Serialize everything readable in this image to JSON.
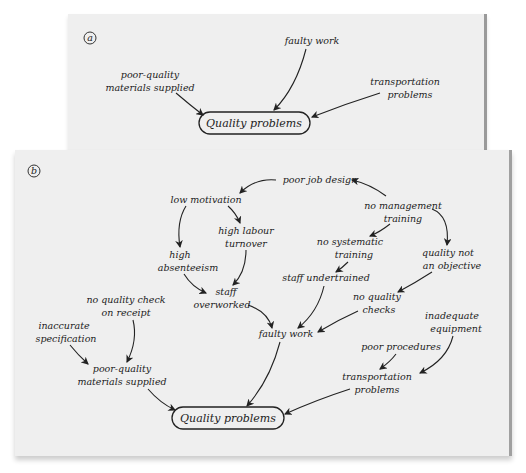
{
  "figure": {
    "panel_a": {
      "badge": "a",
      "center": "Quality problems",
      "causes": [
        {
          "id": "faulty_work",
          "lines": [
            "faulty work"
          ]
        },
        {
          "id": "poor_quality_materials",
          "lines": [
            "poor-quality",
            "materials supplied"
          ]
        },
        {
          "id": "transportation_problems",
          "lines": [
            "transportation",
            "problems"
          ]
        }
      ]
    },
    "panel_b": {
      "badge": "b",
      "center": "Quality problems",
      "nodes": {
        "poor_job_design": [
          "poor job design"
        ],
        "low_motivation": [
          "low motivation"
        ],
        "no_management_training": [
          "no management",
          "training"
        ],
        "high_labour_turnover": [
          "high labour",
          "turnover"
        ],
        "high_absenteeism": [
          "high",
          "absenteeism"
        ],
        "no_systematic_training": [
          "no systematic",
          "training"
        ],
        "quality_not_objective": [
          "quality not",
          "an objective"
        ],
        "staff_undertrained": [
          "staff undertrained"
        ],
        "staff_overworked": [
          "staff",
          "overworked"
        ],
        "no_quality_checks": [
          "no quality",
          "checks"
        ],
        "no_quality_check_receipt": [
          "no quality check",
          "on receipt"
        ],
        "inaccurate_specification": [
          "inaccurate",
          "specification"
        ],
        "inadequate_equipment": [
          "inadequate",
          "equipment"
        ],
        "faulty_work": [
          "faulty work"
        ],
        "poor_procedures": [
          "poor procedures"
        ],
        "poor_quality_materials": [
          "poor-quality",
          "materials supplied"
        ],
        "transportation_problems": [
          "transportation",
          "problems"
        ]
      },
      "edges": [
        [
          "poor_job_design",
          "low_motivation"
        ],
        [
          "no_management_training",
          "poor_job_design"
        ],
        [
          "low_motivation",
          "high_absenteeism"
        ],
        [
          "low_motivation",
          "high_labour_turnover"
        ],
        [
          "no_management_training",
          "no_systematic_training"
        ],
        [
          "no_management_training",
          "quality_not_objective"
        ],
        [
          "high_absenteeism",
          "staff_overworked"
        ],
        [
          "high_labour_turnover",
          "staff_overworked"
        ],
        [
          "no_systematic_training",
          "staff_undertrained"
        ],
        [
          "quality_not_objective",
          "no_quality_checks"
        ],
        [
          "staff_overworked",
          "faulty_work"
        ],
        [
          "staff_undertrained",
          "faulty_work"
        ],
        [
          "no_quality_checks",
          "faulty_work"
        ],
        [
          "no_quality_check_receipt",
          "poor_quality_materials"
        ],
        [
          "inaccurate_specification",
          "poor_quality_materials"
        ],
        [
          "poor_procedures",
          "transportation_problems"
        ],
        [
          "inadequate_equipment",
          "transportation_problems"
        ],
        [
          "poor_quality_materials",
          "quality_problems"
        ],
        [
          "faulty_work",
          "quality_problems"
        ],
        [
          "transportation_problems",
          "quality_problems"
        ]
      ]
    }
  }
}
